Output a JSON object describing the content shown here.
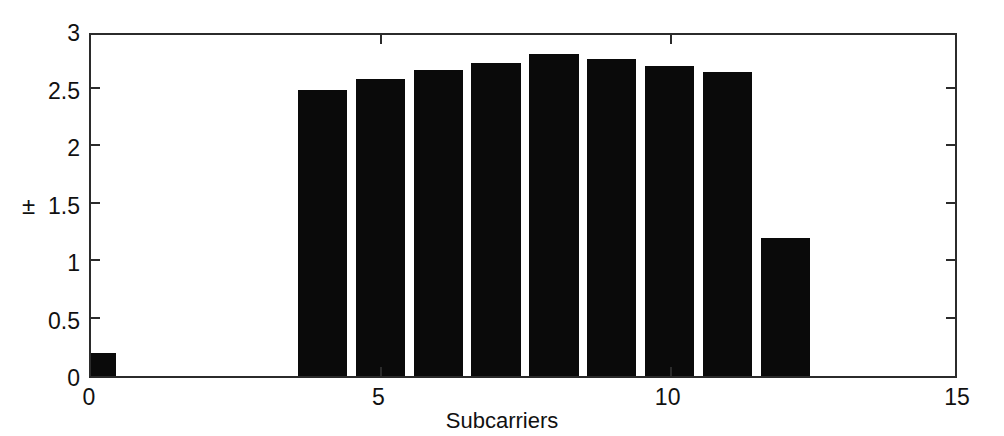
{
  "chart_data": {
    "type": "bar",
    "title": "",
    "subtitle": "",
    "xlabel": "Subcarriers",
    "ylabel": "±",
    "x": [
      0,
      4,
      5,
      6,
      7,
      8,
      9,
      10,
      11,
      12
    ],
    "values": [
      0.2,
      2.49,
      2.58,
      2.66,
      2.72,
      2.8,
      2.76,
      2.7,
      2.64,
      1.2
    ],
    "categories": [
      "0",
      "4",
      "5",
      "6",
      "7",
      "8",
      "9",
      "10",
      "11",
      "12"
    ],
    "series": [
      {
        "name": "Subcarrier magnitude",
        "values": [
          0.2,
          2.49,
          2.58,
          2.66,
          2.72,
          2.8,
          2.76,
          2.7,
          2.64,
          1.2
        ]
      }
    ],
    "bar_color": "#0a0a0a",
    "bar_width": 0.85,
    "xlim": [
      0,
      15
    ],
    "ylim": [
      0,
      3
    ],
    "xticks": [
      0,
      5,
      10,
      15
    ],
    "xticklabels": [
      "0",
      "5",
      "10",
      "15"
    ],
    "yticks": [
      0,
      0.5,
      1,
      1.5,
      2,
      2.5,
      3
    ],
    "yticklabels": [
      "0",
      "0.5",
      "1",
      "1.5",
      "2",
      "2.5",
      "3"
    ],
    "grid": false,
    "legend": false,
    "legend_position": "none",
    "axes_color": "#2b2b2b",
    "background": "#ffffff",
    "tick_direction": "in",
    "box": true
  }
}
